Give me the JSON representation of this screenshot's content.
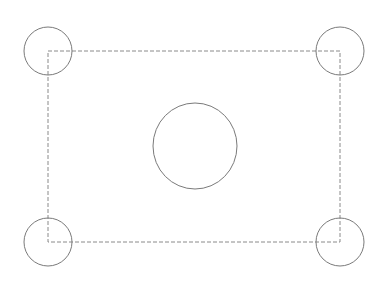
{
  "canvas": {
    "width": 392,
    "height": 281,
    "background": "#ffffff"
  },
  "colors": {
    "circle_stroke": "#7a7a7a",
    "rect_stroke": "#8a8a8a"
  },
  "diagram": {
    "rectangle": {
      "x": 48,
      "y": 51,
      "width": 292,
      "height": 191,
      "style": "dashed",
      "dasharray": "4 2",
      "stroke_width": 1
    },
    "corner_circles": [
      {
        "name": "top-left",
        "cx": 48,
        "cy": 51,
        "r": 24
      },
      {
        "name": "top-right",
        "cx": 340,
        "cy": 51,
        "r": 24
      },
      {
        "name": "bottom-left",
        "cx": 48,
        "cy": 242,
        "r": 24
      },
      {
        "name": "bottom-right",
        "cx": 340,
        "cy": 242,
        "r": 24
      }
    ],
    "center_circle": {
      "cx": 195,
      "cy": 146,
      "rx": 42,
      "ry": 43
    }
  }
}
